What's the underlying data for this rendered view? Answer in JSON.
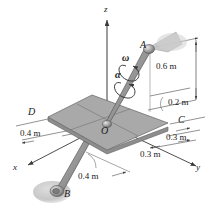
{
  "figure": {
    "type": "engineering-mechanics-3d-diagram",
    "colors": {
      "plate_fill": "#a9a9a9",
      "plate_edge": "#6f6f6f",
      "rod_fill": "#9a9a9a",
      "rod_edge": "#5a5a5a",
      "line": "#4a4a4a",
      "shadow": "#c9c9c9",
      "text": "#1a1a1a",
      "background": "#ffffff"
    }
  },
  "axes": {
    "z_label": "z",
    "x_label": "x",
    "y_label": "y"
  },
  "points": {
    "A": "A",
    "B": "B",
    "C": "C",
    "D": "D",
    "O": "O"
  },
  "vectors": {
    "omega": "ω",
    "alpha": "α"
  },
  "dimensions": [
    {
      "id": "height-a",
      "value": "0.6 m"
    },
    {
      "id": "offset-a",
      "value": "0.2 m"
    },
    {
      "id": "plate-left",
      "value": "0.4 m"
    },
    {
      "id": "plate-right-near",
      "value": "0.3 m"
    },
    {
      "id": "plate-right-far",
      "value": "0.3 m"
    },
    {
      "id": "rod-b",
      "value": "0.4 m"
    }
  ]
}
